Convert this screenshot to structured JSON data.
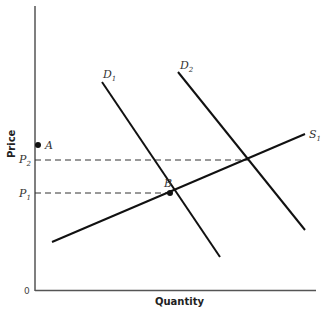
{
  "diagram": {
    "type": "supply-demand",
    "xlabel": "Quantity",
    "ylabel": "Price",
    "origin_label": "0",
    "curves": [
      {
        "name": "S",
        "sub": "1",
        "x1": 52,
        "y1": 242,
        "x2": 305,
        "y2": 134
      },
      {
        "name": "D",
        "sub": "1",
        "x1": 102,
        "y1": 82,
        "x2": 220,
        "y2": 257
      },
      {
        "name": "D",
        "sub": "2",
        "x1": 178,
        "y1": 72,
        "x2": 305,
        "y2": 230
      }
    ],
    "price_levels": [
      {
        "name": "P",
        "sub": "1",
        "y": 193,
        "x_end": 170
      },
      {
        "name": "P",
        "sub": "2",
        "y": 160,
        "x_end": 248
      }
    ],
    "points": [
      {
        "name": "A",
        "x": 38,
        "y": 145
      },
      {
        "name": "B",
        "x": 170,
        "y": 193
      }
    ],
    "labels": {
      "S1": "S",
      "S1_sub": "1",
      "D1": "D",
      "D1_sub": "1",
      "D2": "D",
      "D2_sub": "2",
      "P1": "P",
      "P1_sub": "1",
      "P2": "P",
      "P2_sub": "2",
      "A": "A",
      "B": "B"
    }
  }
}
